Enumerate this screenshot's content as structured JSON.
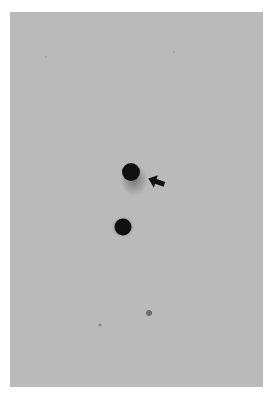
{
  "figure": {
    "background": "#ffffff",
    "panel": {
      "x": 10,
      "y": 12,
      "width": 253,
      "height": 375,
      "color": "#b9b9b9"
    },
    "spots": [
      {
        "id": "upper-spot",
        "cx": 121,
        "cy": 160,
        "r": 9,
        "color": "#111111"
      },
      {
        "id": "lower-spot",
        "cx": 113,
        "cy": 215,
        "r": 8.5,
        "color": "#0f0f0f"
      },
      {
        "id": "faint-spot",
        "cx": 139,
        "cy": 301,
        "r": 3,
        "color": "#555555"
      },
      {
        "id": "tiny-speck",
        "cx": 90,
        "cy": 313,
        "r": 1.5,
        "color": "#888888"
      }
    ],
    "arrow": {
      "tip_x": 138,
      "tip_y": 169,
      "direction": "left",
      "color": "#111111"
    }
  }
}
